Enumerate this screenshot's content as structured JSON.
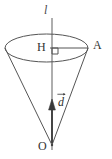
{
  "figure": {
    "type": "geometry-diagram",
    "background_color": "#ffffff",
    "stroke_color": "#555555",
    "axis_color": "#8a8a8a",
    "vector_color": "#3a3a3a",
    "label_color": "#333333",
    "labels": {
      "axis": "l",
      "center": "H",
      "radius_point": "A",
      "apex": "O",
      "vector": "d"
    },
    "markers": {
      "right_angle": "right-angle-square"
    },
    "geometry": {
      "ellipse_center_x": 46.5,
      "ellipse_center_y": 48,
      "ellipse_rx": 41.5,
      "ellipse_ry": 14,
      "apex_x": 52,
      "apex_y": 145,
      "axis_top_y": 18,
      "axis_bottom_y": 150,
      "vector_tail_y": 143,
      "vector_head_y": 101
    }
  }
}
